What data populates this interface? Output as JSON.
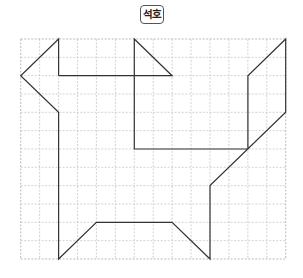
{
  "title": {
    "label": "석호"
  },
  "grid": {
    "cols": 14,
    "rows": 12,
    "origin_x": 20.7,
    "origin_y": 39,
    "cell_w": 18.93,
    "cell_h": 18.33,
    "line_color": "#c8c8c8",
    "border_color": "#aaaaaa"
  },
  "figure": {
    "stroke_color": "#333333",
    "points_grid": [
      [
        2,
        2
      ],
      [
        2,
        0
      ],
      [
        0,
        2
      ],
      [
        2,
        4
      ],
      [
        2,
        12
      ],
      [
        4,
        10
      ],
      [
        8,
        10
      ],
      [
        10,
        12
      ],
      [
        10,
        8
      ],
      [
        14,
        4
      ],
      [
        14,
        0
      ],
      [
        12,
        2
      ],
      [
        12,
        6
      ],
      [
        6,
        6
      ],
      [
        6,
        0
      ],
      [
        8,
        2
      ],
      [
        2,
        2
      ]
    ]
  }
}
